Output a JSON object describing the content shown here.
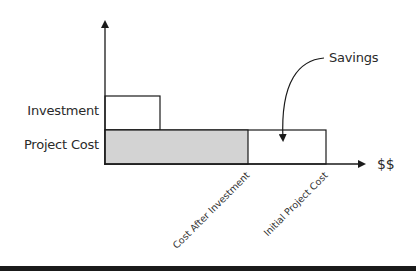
{
  "diagram": {
    "type": "horizontal-bar-savings-diagram",
    "y_labels": {
      "investment": "Investment",
      "project_cost": "Project Cost"
    },
    "x_axis_label": "$$",
    "x_tick_labels": {
      "cost_after_investment": "Cost After Investment",
      "initial_project_cost": "Initial Project Cost"
    },
    "annotation": "Savings",
    "colors": {
      "line": "#1a1a1a",
      "shaded_bar": "#d3d3d3",
      "open_bar": "#ffffff",
      "text": "#2a2a2a"
    }
  }
}
